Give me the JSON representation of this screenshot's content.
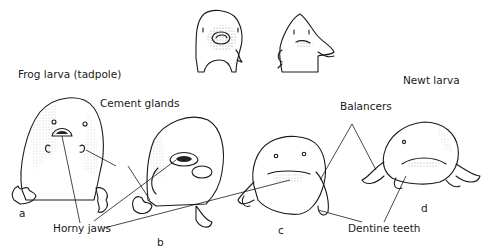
{
  "figure": {
    "titles": {
      "frog": "Frog larva (tadpole)",
      "newt": "Newt larva"
    },
    "labels": {
      "cement_glands": "Cement glands",
      "horny_jaws": "Horny jaws",
      "balancers": "Balancers",
      "dentine_teeth": "Dentine teeth"
    },
    "panels": [
      {
        "letter": "a"
      },
      {
        "letter": "b"
      },
      {
        "letter": "c"
      },
      {
        "letter": "d"
      }
    ],
    "colors": {
      "ink": "#1a1a1a",
      "background": "#ffffff"
    }
  }
}
